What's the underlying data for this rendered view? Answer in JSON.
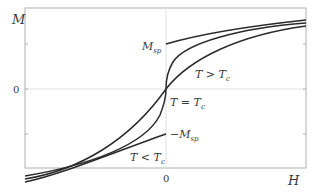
{
  "axes": {
    "y_label": "M",
    "x_label": "H",
    "y_zero_label": "0",
    "x_zero_label": "0"
  },
  "labels": {
    "m_sp": "M",
    "m_sp_sub": "sp",
    "neg_m_sp": "−M",
    "neg_m_sp_sub": "sp",
    "t_above": "T > T",
    "t_above_sub": "c",
    "t_equal": "T = T",
    "t_equal_sub": "c",
    "t_below": "T < T",
    "t_below_sub": "c"
  },
  "colors": {
    "curve": "#2a2a2a",
    "frame": "#b0b0b0",
    "grid": "#e0e0e0"
  }
}
